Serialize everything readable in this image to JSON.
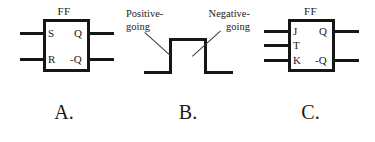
{
  "figure": {
    "background_color": "#ffffff",
    "ink_color": "#161616",
    "panels": [
      {
        "id": "a",
        "caption": "A.",
        "type": "sr-flip-flop-symbol",
        "block_title": "FF",
        "inputs": [
          "S",
          "R"
        ],
        "outputs": [
          "Q",
          "-Q"
        ]
      },
      {
        "id": "b",
        "caption": "B.",
        "type": "pulse-waveform",
        "annotations": [
          {
            "line1": "Positive-",
            "line2": "going"
          },
          {
            "line1": "Negative-",
            "line2": "going"
          }
        ]
      },
      {
        "id": "c",
        "caption": "C.",
        "type": "jk-flip-flop-symbol",
        "block_title": "FF",
        "inputs": [
          "J",
          "T",
          "K"
        ],
        "outputs": [
          "Q",
          "-Q"
        ]
      }
    ]
  }
}
